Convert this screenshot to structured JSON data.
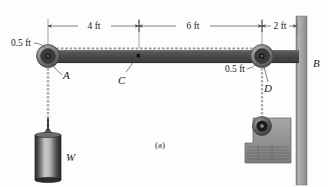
{
  "figure": {
    "caption": "(a)",
    "type": "statics-free-body-diagram"
  },
  "dimensions": [
    {
      "id": "span-ac",
      "label": "4 ft",
      "from": "A",
      "to": "C",
      "value": 4,
      "unit": "ft"
    },
    {
      "id": "span-cd",
      "label": "6 ft",
      "from": "C",
      "to": "D",
      "value": 6,
      "unit": "ft"
    },
    {
      "id": "span-dwall",
      "label": "2 ft",
      "from": "D",
      "to": "B",
      "value": 2,
      "unit": "ft"
    }
  ],
  "radii": [
    {
      "id": "pulley-a-radius",
      "label": "0.5 ft",
      "value": 0.5,
      "unit": "ft",
      "at": "A"
    },
    {
      "id": "pulley-d-radius",
      "label": "0.5 ft",
      "value": 0.5,
      "unit": "ft",
      "at": "D"
    }
  ],
  "points": [
    {
      "id": "A",
      "label": "A",
      "description": "left pulley center"
    },
    {
      "id": "B",
      "label": "B",
      "description": "vertical wall"
    },
    {
      "id": "C",
      "label": "C",
      "description": "beam midpoint marker"
    },
    {
      "id": "D",
      "label": "D",
      "description": "right pulley center"
    },
    {
      "id": "W",
      "label": "W",
      "description": "suspended cylindrical weight"
    }
  ],
  "colors": {
    "beam": "#4a4a4a",
    "beam_highlight": "#6e6e6e",
    "wall": "#9a9a9a",
    "pulley": "#8a8a8a",
    "pulley_hub": "#2b2b2b",
    "cable": "#b8b8b8",
    "winch": "#909090",
    "weight_dark": "#2e2e2e",
    "weight_light": "#cfcfcf",
    "dimension_line": "#5a5a5a",
    "text": "#1a1a1a"
  }
}
